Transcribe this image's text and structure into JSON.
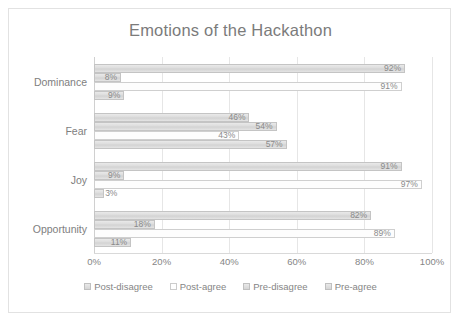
{
  "chart_data": {
    "type": "bar",
    "orientation": "horizontal",
    "title": "Emotions of the Hackathon",
    "xlabel": "",
    "ylabel": "",
    "xlim": [
      0,
      100
    ],
    "xticks": [
      "0%",
      "20%",
      "40%",
      "60%",
      "80%",
      "100%"
    ],
    "xtick_values": [
      0,
      20,
      40,
      60,
      80,
      100
    ],
    "grid": true,
    "legend_position": "bottom",
    "categories": [
      "Dominance",
      "Fear",
      "Joy",
      "Opportunity"
    ],
    "series": [
      {
        "name": "Post-disagree",
        "values": [
          9,
          57,
          3,
          11
        ],
        "labels": [
          "9%",
          "57%",
          "3%",
          "11%"
        ],
        "fill": "shaded"
      },
      {
        "name": "Post-agree",
        "values": [
          91,
          43,
          97,
          89
        ],
        "labels": [
          "91%",
          "43%",
          "97%",
          "89%"
        ],
        "fill": "hollow"
      },
      {
        "name": "Pre-disagree",
        "values": [
          8,
          54,
          9,
          18
        ],
        "labels": [
          "8%",
          "54%",
          "9%",
          "18%"
        ],
        "fill": "shaded"
      },
      {
        "name": "Pre-agree",
        "values": [
          92,
          46,
          91,
          82
        ],
        "labels": [
          "92%",
          "46%",
          "91%",
          "82%"
        ],
        "fill": "shaded"
      }
    ]
  },
  "style": {
    "bar_fill": "#dcdcdc",
    "bar_border": "#c4c4c4",
    "hollow_fill": "#fdfdfd",
    "text_color": "#808080",
    "grid_color": "#e6e6e6",
    "frame_border": "#e2e2e2",
    "background": "#ffffff"
  }
}
